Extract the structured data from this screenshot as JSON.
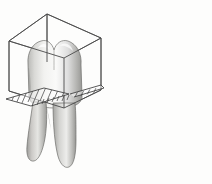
{
  "illustration": {
    "title": "Tooth geometric form comparison",
    "background_color": "#fdfdfc",
    "line_color": "#4a4a4a",
    "hatch_color": "#3c3c3c",
    "enamel_light": "#fbfbfa",
    "enamel_mid": "#d8d8d6",
    "enamel_shadow": "#a9a9a6",
    "enamel_dark": "#8d8d8a",
    "width": 212,
    "height": 184
  },
  "figures": [
    {
      "id": "left-figure",
      "name": "molar-in-cube",
      "tooth_type": "molar",
      "root_count": 2,
      "cusp_count": 2,
      "geometric_solid": "cube",
      "solid_label": "cube",
      "section_plane": "horizontal-hatched-plane",
      "hatch_marks": 9,
      "crown_description": "Multi-cusped molar crown enclosed by a wireframe cube",
      "root_description": "Two divergent tapering roots extending below the section plane"
    },
    {
      "id": "right-figure",
      "name": "canine-in-triangle",
      "tooth_type": "canine",
      "root_count": 1,
      "cusp_count": 1,
      "geometric_solid": "triangle",
      "solid_label": "triangle",
      "section_plane": "horizontal-hatched-plane",
      "hatch_marks": 9,
      "crown_description": "Single pointed canine cusp enclosed by a triangular wireframe",
      "root_description": "One long tapering root extending below the section plane"
    }
  ],
  "chart_data": {
    "type": "diagram",
    "categories": [
      "molar",
      "canine"
    ],
    "series": [
      {
        "name": "root_count",
        "values": [
          2,
          1
        ]
      },
      {
        "name": "cusp_count",
        "values": [
          2,
          1
        ]
      }
    ],
    "annotations": [
      "cube",
      "triangle"
    ]
  }
}
